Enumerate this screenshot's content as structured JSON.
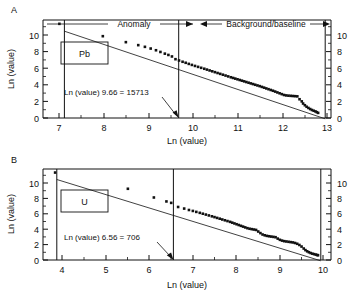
{
  "figure": {
    "panels": [
      {
        "letter": "A",
        "box_label": "Pb",
        "xlabel": "Ln (value)",
        "ylabel": "Ln (value)",
        "xticks": [
          7,
          8,
          9,
          10,
          11,
          12,
          13
        ],
        "yticks": [
          0,
          2,
          4,
          6,
          8,
          10
        ],
        "xlim": [
          6.75,
          13.25
        ],
        "ylim": [
          -0.6,
          10.9
        ],
        "annotation": "Ln (value) 9.66 = 15713",
        "threshold_x": 9.66,
        "left_bound_x": 7.12,
        "right_bound_x": 12.96,
        "headers": [
          {
            "label": "Anomaly",
            "x_start": 7.12,
            "x_end": 9.66
          },
          {
            "label": "Background/baseline",
            "x_start": 9.66,
            "x_end": 12.96
          }
        ]
      },
      {
        "letter": "B",
        "box_label": "U",
        "xlabel": "Ln (value)",
        "ylabel": "Ln (value)",
        "xticks": [
          4,
          5,
          6,
          7,
          8,
          9,
          10
        ],
        "yticks": [
          0,
          2,
          4,
          6,
          8,
          10
        ],
        "xlim": [
          3.6,
          10.25
        ],
        "ylim": [
          -0.6,
          10.9
        ],
        "annotation": "Ln (value) 6.56 = 706",
        "threshold_x": 6.56,
        "left_bound_x": 3.88,
        "right_bound_x": 9.95,
        "headers": []
      }
    ]
  },
  "chart_data": [
    {
      "type": "scatter",
      "title": "",
      "panel": "A",
      "element": "Pb",
      "xlabel": "Ln (value)",
      "ylabel": "Ln (value)",
      "xlim": [
        6.75,
        13.25
      ],
      "ylim": [
        -0.6,
        10.9
      ],
      "xticks": [
        7,
        8,
        9,
        10,
        11,
        12,
        13
      ],
      "yticks": [
        0,
        2,
        4,
        6,
        8,
        10
      ],
      "grid": false,
      "legend": null,
      "annotations": [
        {
          "text": "Anomaly",
          "type": "span-arrow",
          "x_start": 7.12,
          "x_end": 9.66,
          "y": 10.55
        },
        {
          "text": "Background/baseline",
          "type": "span-arrow",
          "x_start": 9.66,
          "x_end": 12.96,
          "y": 10.55
        },
        {
          "text": "Ln (value) 9.66 = 15713",
          "type": "leader-label",
          "points_to_x": 9.66,
          "points_to_y": 0.0
        }
      ],
      "reference_lines": [
        {
          "type": "vertical",
          "x": 7.12
        },
        {
          "type": "vertical",
          "x": 9.66,
          "label": "threshold"
        },
        {
          "type": "vertical",
          "x": 12.96
        }
      ],
      "fit_line": {
        "x": [
          7.12,
          12.96
        ],
        "y": [
          10.45,
          -0.1
        ]
      },
      "series": [
        {
          "name": "Pb cumulative rank",
          "x": [
            7.12,
            8.1,
            8.62,
            8.9,
            9.05,
            9.18,
            9.3,
            9.4,
            9.5,
            9.58,
            9.66,
            9.74,
            9.82,
            9.9,
            9.97,
            10.04,
            10.11,
            10.18,
            10.25,
            10.32,
            10.39,
            10.45,
            10.51,
            10.57,
            10.63,
            10.69,
            10.75,
            10.81,
            10.87,
            10.93,
            10.99,
            11.04,
            11.09,
            11.14,
            11.19,
            11.24,
            11.29,
            11.34,
            11.39,
            11.44,
            11.49,
            11.54,
            11.59,
            11.64,
            11.69,
            11.74,
            11.79,
            11.84,
            11.89,
            11.94,
            11.99,
            12.04,
            12.09,
            12.14,
            12.19,
            12.24,
            12.29,
            12.34,
            12.39,
            12.44,
            12.49,
            12.54,
            12.59,
            12.62,
            12.66,
            12.7,
            12.74,
            12.78,
            12.82,
            12.86,
            12.9,
            12.93,
            12.96
          ],
          "y": [
            10.45,
            9.0,
            8.3,
            7.95,
            7.75,
            7.55,
            7.35,
            7.15,
            6.95,
            6.8,
            6.62,
            6.3,
            6.15,
            6.0,
            5.88,
            5.75,
            5.63,
            5.51,
            5.4,
            5.29,
            5.18,
            5.08,
            4.98,
            4.88,
            4.78,
            4.68,
            4.58,
            4.48,
            4.38,
            4.28,
            4.18,
            4.1,
            4.02,
            3.94,
            3.86,
            3.78,
            3.7,
            3.62,
            3.54,
            3.46,
            3.38,
            3.3,
            3.22,
            3.14,
            3.05,
            2.96,
            2.87,
            2.78,
            2.69,
            2.6,
            2.5,
            2.4,
            2.3,
            2.2,
            2.1,
            2.05,
            2.02,
            2.0,
            1.98,
            1.96,
            1.94,
            1.6,
            1.35,
            1.1,
            0.9,
            0.72,
            0.58,
            0.45,
            0.34,
            0.25,
            0.17,
            0.08,
            0.0
          ]
        }
      ]
    },
    {
      "type": "scatter",
      "title": "",
      "panel": "B",
      "element": "U",
      "xlabel": "Ln (value)",
      "ylabel": "Ln (value)",
      "xlim": [
        3.6,
        10.25
      ],
      "ylim": [
        -0.6,
        10.9
      ],
      "xticks": [
        4,
        5,
        6,
        7,
        8,
        9,
        10
      ],
      "yticks": [
        0,
        2,
        4,
        6,
        8,
        10
      ],
      "grid": false,
      "legend": null,
      "annotations": [
        {
          "text": "Ln (value) 6.56 = 706",
          "type": "leader-label",
          "points_to_x": 6.56,
          "points_to_y": 0.0
        }
      ],
      "reference_lines": [
        {
          "type": "vertical",
          "x": 3.88
        },
        {
          "type": "vertical",
          "x": 6.56,
          "label": "threshold"
        },
        {
          "type": "vertical",
          "x": 9.95
        }
      ],
      "fit_line": {
        "x": [
          3.88,
          9.95
        ],
        "y": [
          10.45,
          -0.1
        ]
      },
      "series": [
        {
          "name": "U cumulative rank",
          "x": [
            3.88,
            5.56,
            6.16,
            6.45,
            6.56,
            6.72,
            6.86,
            6.97,
            7.06,
            7.14,
            7.22,
            7.29,
            7.36,
            7.43,
            7.5,
            7.56,
            7.62,
            7.68,
            7.74,
            7.8,
            7.86,
            7.92,
            7.97,
            8.02,
            8.07,
            8.12,
            8.17,
            8.22,
            8.27,
            8.32,
            8.37,
            8.42,
            8.47,
            8.52,
            8.57,
            8.62,
            8.67,
            8.72,
            8.77,
            8.82,
            8.87,
            8.92,
            8.97,
            9.02,
            9.07,
            9.12,
            9.17,
            9.22,
            9.27,
            9.32,
            9.37,
            9.42,
            9.47,
            9.52,
            9.57,
            9.62,
            9.66,
            9.7,
            9.74,
            9.78,
            9.82,
            9.86,
            9.9,
            9.93,
            9.95
          ],
          "y": [
            10.45,
            8.4,
            7.3,
            6.8,
            6.62,
            6.1,
            5.9,
            5.72,
            5.6,
            5.48,
            5.36,
            5.25,
            5.14,
            5.03,
            4.92,
            4.82,
            4.72,
            4.62,
            4.52,
            4.42,
            4.32,
            4.22,
            4.12,
            4.02,
            3.92,
            3.82,
            3.72,
            3.62,
            3.52,
            3.42,
            3.35,
            3.3,
            3.25,
            3.2,
            3.0,
            2.8,
            2.62,
            2.52,
            2.45,
            2.4,
            2.36,
            2.32,
            2.28,
            2.1,
            1.95,
            1.85,
            1.78,
            1.74,
            1.7,
            1.66,
            1.62,
            1.55,
            1.45,
            1.3,
            1.1,
            0.85,
            0.65,
            0.5,
            0.38,
            0.28,
            0.2,
            0.14,
            0.08,
            0.03,
            0.0
          ]
        }
      ]
    }
  ]
}
